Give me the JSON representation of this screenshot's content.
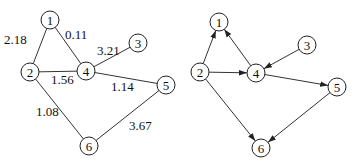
{
  "left_graph": {
    "type": "undirected-weighted",
    "nodes": [
      {
        "id": "1",
        "x": 50,
        "y": 20
      },
      {
        "id": "2",
        "x": 30,
        "y": 72
      },
      {
        "id": "3",
        "x": 138,
        "y": 43
      },
      {
        "id": "4",
        "x": 86,
        "y": 71
      },
      {
        "id": "5",
        "x": 166,
        "y": 85
      },
      {
        "id": "6",
        "x": 89,
        "y": 146
      }
    ],
    "edges": [
      {
        "from": "1",
        "to": "2",
        "weight": "2.18",
        "lx": 4,
        "ly": 44
      },
      {
        "from": "1",
        "to": "4",
        "weight": "0.11",
        "lx": 65,
        "ly": 39
      },
      {
        "from": "4",
        "to": "3",
        "weight": "3.21",
        "lx": 97,
        "ly": 55
      },
      {
        "from": "2",
        "to": "4",
        "weight": "1.56",
        "lx": 51,
        "ly": 84
      },
      {
        "from": "4",
        "to": "5",
        "weight": "1.14",
        "lx": 111,
        "ly": 91
      },
      {
        "from": "2",
        "to": "6",
        "weight": "1.08",
        "lx": 36,
        "ly": 116
      },
      {
        "from": "5",
        "to": "6",
        "weight": "3.67",
        "lx": 129,
        "ly": 130
      }
    ]
  },
  "right_graph": {
    "type": "directed",
    "nodes": [
      {
        "id": "1",
        "x": 219,
        "y": 22
      },
      {
        "id": "2",
        "x": 200,
        "y": 72
      },
      {
        "id": "3",
        "x": 307,
        "y": 45
      },
      {
        "id": "4",
        "x": 256,
        "y": 73
      },
      {
        "id": "5",
        "x": 337,
        "y": 87
      },
      {
        "id": "6",
        "x": 261,
        "y": 148
      }
    ],
    "edges": [
      {
        "from": "2",
        "to": "1"
      },
      {
        "from": "4",
        "to": "1"
      },
      {
        "from": "2",
        "to": "4"
      },
      {
        "from": "3",
        "to": "4"
      },
      {
        "from": "4",
        "to": "5"
      },
      {
        "from": "2",
        "to": "6"
      },
      {
        "from": "5",
        "to": "6"
      }
    ]
  },
  "style": {
    "node_radius": 9,
    "edge_color": "#333333",
    "node_stroke": "#222222"
  }
}
